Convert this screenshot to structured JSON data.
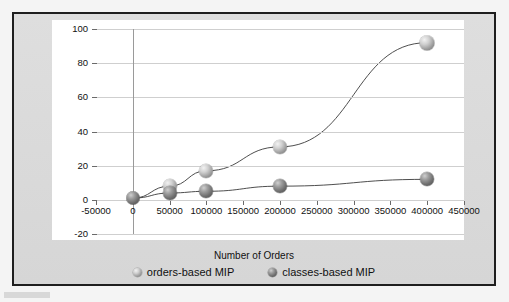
{
  "chart_data": {
    "type": "scatter",
    "title": "",
    "xlabel": "Number of Orders",
    "ylabel": "Number of Decision Variables in V0",
    "xlim": [
      -50000,
      450000
    ],
    "ylim": [
      -20,
      100
    ],
    "xticks": [
      "-50000",
      "0",
      "50000",
      "100000",
      "150000",
      "200000",
      "250000",
      "300000",
      "350000",
      "400000",
      "450000"
    ],
    "xtick_values": [
      -50000,
      0,
      50000,
      100000,
      150000,
      200000,
      250000,
      300000,
      350000,
      400000,
      450000
    ],
    "yticks": [
      "100",
      "80",
      "60",
      "40",
      "20",
      "0",
      "-20"
    ],
    "ytick_values": [
      100,
      80,
      60,
      40,
      20,
      0,
      -20
    ],
    "grid": "horizontal",
    "legend_position": "bottom",
    "series": [
      {
        "name": "orders-based MIP",
        "marker": "sphere-light",
        "x": [
          0,
          50000,
          100000,
          200000,
          400000
        ],
        "values": [
          1,
          8,
          17,
          31,
          92
        ]
      },
      {
        "name": "classes-based MIP",
        "marker": "sphere-dark",
        "x": [
          0,
          50000,
          100000,
          200000,
          400000
        ],
        "values": [
          1,
          4,
          5,
          8,
          12
        ]
      }
    ]
  },
  "axes": {
    "x_title": "Number of Orders",
    "y_title": "Number of Decision Variables in V0"
  },
  "legend": {
    "items": [
      {
        "label": "orders-based MIP",
        "marker": "sphere-light"
      },
      {
        "label": "classes-based MIP",
        "marker": "sphere-dark"
      }
    ]
  },
  "colors": {
    "panel_background": "#ffffff",
    "figure_background": "#d9d9d9",
    "frame_border": "#1e1e1e",
    "gridline": "#cfcfcf",
    "axis": "#6a6a6a",
    "text": "#111111",
    "series_light": "#d0d0d0",
    "series_dark": "#6e6e6e",
    "line": "#3a3a3a"
  }
}
